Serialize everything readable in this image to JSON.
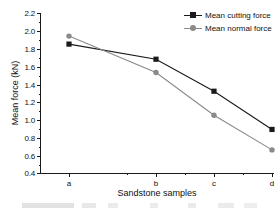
{
  "chart_data": {
    "type": "line",
    "title": "",
    "xlabel": "Sandstone samples",
    "ylabel": "Mean force (kN)",
    "categories": [
      "a",
      "b",
      "c",
      "d"
    ],
    "ylim": [
      0.4,
      2.2
    ],
    "yticks": [
      "0.4",
      "0.6",
      "0.8",
      "1.0",
      "1.2",
      "1.4",
      "1.6",
      "1.8",
      "2.0",
      "2.2"
    ],
    "ytick_step": 0.2,
    "grid": false,
    "legend_position": "top-right",
    "series": [
      {
        "name": "Mean cutting force",
        "marker": "square",
        "color": "#1a1a1a",
        "values": [
          1.85,
          1.68,
          1.32,
          0.89
        ]
      },
      {
        "name": "Mean normal force",
        "marker": "circle",
        "color": "#8a8a8a",
        "values": [
          1.94,
          1.53,
          1.05,
          0.66
        ]
      }
    ]
  },
  "axis": {
    "y_title": "Mean force (kN)",
    "x_title": "Sandstone samples",
    "y_tick_labels": [
      "2.2",
      "2.0",
      "1.8",
      "1.6",
      "1.4",
      "1.2",
      "1.0",
      "0.8",
      "0.6",
      "0.4"
    ],
    "x_tick_labels": [
      "a",
      "b",
      "c",
      "d"
    ]
  },
  "legend": {
    "items": [
      {
        "label": "Mean cutting force",
        "marker": "square-marker",
        "color": "#1a1a1a"
      },
      {
        "label": "Mean normal force",
        "marker": "circle-marker",
        "color": "#8a8a8a"
      }
    ]
  },
  "colors": {
    "cutting_force": "#1a1a1a",
    "normal_force": "#8a8a8a",
    "axis": "#1a1a1a",
    "background": "#ffffff"
  }
}
